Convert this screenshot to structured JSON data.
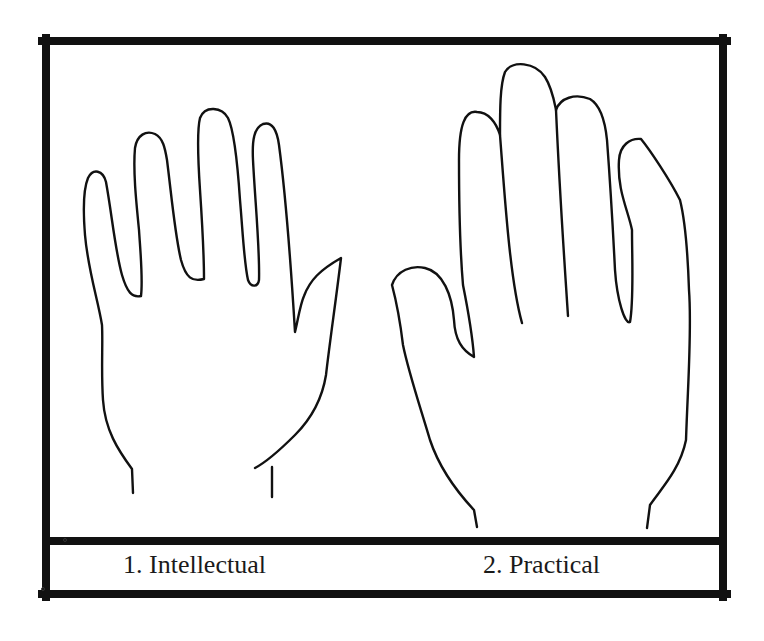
{
  "figure": {
    "frame_color": "#111111",
    "line_color": "#111111",
    "background": "#ffffff",
    "panels": [
      {
        "number": "1",
        "label": "1. Intellectual",
        "description": "hand with long slender fingers and narrow palm"
      },
      {
        "number": "2",
        "label": "2. Practical",
        "description": "hand with broad palm and thick fingers"
      }
    ]
  }
}
